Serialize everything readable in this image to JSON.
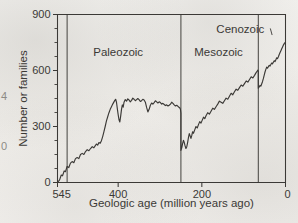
{
  "figure": {
    "kind": "scanned-line-chart",
    "ink_color": "#3b3936",
    "paper_color": "#f2f1ee"
  },
  "edge_fragments": [
    {
      "text": "4",
      "x": 1,
      "y": 96
    },
    {
      "text": "0",
      "x": 1,
      "y": 146
    }
  ],
  "chart_data": {
    "type": "line",
    "title": "",
    "xlabel": "Geologic age (million years ago)",
    "ylabel": "Number or families",
    "xlim": [
      545,
      0
    ],
    "ylim": [
      0,
      900
    ],
    "x_reversed": true,
    "grid": false,
    "legend": "none",
    "xticks": [
      545,
      400,
      200,
      0
    ],
    "xtick_labels": [
      "545",
      "400",
      "200",
      "0"
    ],
    "yticks": [
      0,
      300,
      600,
      900
    ],
    "ytick_labels": [
      "0",
      "300",
      "600",
      "900"
    ],
    "y_minor_tick_step": 75,
    "annotations": [
      {
        "name": "paleozoic-label",
        "text": "Paleozoic",
        "x": 400,
        "y": 700
      },
      {
        "name": "mesozoic-label",
        "text": "Mesozoic",
        "x": 160,
        "y": 700
      },
      {
        "name": "cenozoic-label",
        "text": "Cenozoic",
        "x": 108,
        "y": 820,
        "leader_to_x": 32,
        "leader_to_y": 790
      }
    ],
    "era_boundaries": [
      {
        "name": "paleozoic-start",
        "x": 522
      },
      {
        "name": "paleozoic-mesozoic",
        "x": 250
      },
      {
        "name": "mesozoic-cenozoic",
        "x": 65
      }
    ],
    "series": [
      {
        "name": "Number of families",
        "points": [
          [
            545,
            0
          ],
          [
            540,
            14
          ],
          [
            536,
            40
          ],
          [
            533,
            36
          ],
          [
            529,
            62
          ],
          [
            526,
            58
          ],
          [
            522,
            86
          ],
          [
            518,
            80
          ],
          [
            514,
            104
          ],
          [
            510,
            112
          ],
          [
            506,
            106
          ],
          [
            502,
            128
          ],
          [
            498,
            134
          ],
          [
            494,
            128
          ],
          [
            490,
            150
          ],
          [
            486,
            156
          ],
          [
            482,
            150
          ],
          [
            478,
            166
          ],
          [
            474,
            176
          ],
          [
            470,
            170
          ],
          [
            466,
            182
          ],
          [
            462,
            192
          ],
          [
            458,
            186
          ],
          [
            455,
            196
          ],
          [
            452,
            206
          ],
          [
            449,
            200
          ],
          [
            446,
            214
          ],
          [
            443,
            210
          ],
          [
            440,
            224
          ],
          [
            437,
            246
          ],
          [
            434,
            272
          ],
          [
            431,
            300
          ],
          [
            428,
            330
          ],
          [
            425,
            352
          ],
          [
            422,
            374
          ],
          [
            419,
            392
          ],
          [
            416,
            406
          ],
          [
            413,
            420
          ],
          [
            410,
            432
          ],
          [
            408,
            440
          ],
          [
            406,
            446
          ],
          [
            404,
            430
          ],
          [
            402,
            396
          ],
          [
            400,
            364
          ],
          [
            398,
            336
          ],
          [
            396,
            324
          ],
          [
            394,
            356
          ],
          [
            392,
            392
          ],
          [
            390,
            416
          ],
          [
            388,
            404
          ],
          [
            386,
            430
          ],
          [
            383,
            444
          ],
          [
            380,
            436
          ],
          [
            377,
            448
          ],
          [
            374,
            442
          ],
          [
            371,
            432
          ],
          [
            368,
            440
          ],
          [
            365,
            452
          ],
          [
            362,
            446
          ],
          [
            359,
            438
          ],
          [
            356,
            444
          ],
          [
            353,
            450
          ],
          [
            350,
            444
          ],
          [
            347,
            434
          ],
          [
            344,
            438
          ],
          [
            341,
            446
          ],
          [
            338,
            442
          ],
          [
            335,
            430
          ],
          [
            332,
            402
          ],
          [
            329,
            378
          ],
          [
            326,
            392
          ],
          [
            323,
            414
          ],
          [
            320,
            426
          ],
          [
            317,
            420
          ],
          [
            314,
            428
          ],
          [
            311,
            438
          ],
          [
            308,
            432
          ],
          [
            305,
            426
          ],
          [
            302,
            432
          ],
          [
            299,
            428
          ],
          [
            296,
            420
          ],
          [
            293,
            424
          ],
          [
            290,
            418
          ],
          [
            287,
            412
          ],
          [
            284,
            416
          ],
          [
            281,
            410
          ],
          [
            278,
            414
          ],
          [
            275,
            420
          ],
          [
            272,
            430
          ],
          [
            269,
            424
          ],
          [
            266,
            416
          ],
          [
            263,
            410
          ],
          [
            260,
            414
          ],
          [
            257,
            408
          ],
          [
            254,
            402
          ],
          [
            252,
            398
          ],
          [
            251,
            390
          ],
          [
            250,
            372
          ],
          [
            250,
            300
          ],
          [
            250,
            216
          ],
          [
            250,
            172
          ],
          [
            248,
            186
          ],
          [
            246,
            208
          ],
          [
            244,
            226
          ],
          [
            242,
            214
          ],
          [
            240,
            196
          ],
          [
            238,
            182
          ],
          [
            236,
            192
          ],
          [
            234,
            214
          ],
          [
            232,
            240
          ],
          [
            230,
            262
          ],
          [
            228,
            250
          ],
          [
            226,
            236
          ],
          [
            224,
            252
          ],
          [
            222,
            272
          ],
          [
            220,
            264
          ],
          [
            217,
            282
          ],
          [
            214,
            300
          ],
          [
            211,
            292
          ],
          [
            208,
            310
          ],
          [
            205,
            326
          ],
          [
            202,
            318
          ],
          [
            199,
            334
          ],
          [
            196,
            350
          ],
          [
            193,
            342
          ],
          [
            190,
            358
          ],
          [
            186,
            374
          ],
          [
            182,
            366
          ],
          [
            178,
            382
          ],
          [
            174,
            398
          ],
          [
            170,
            392
          ],
          [
            166,
            406
          ],
          [
            162,
            420
          ],
          [
            158,
            436
          ],
          [
            154,
            430
          ],
          [
            150,
            424
          ],
          [
            146,
            438
          ],
          [
            142,
            452
          ],
          [
            138,
            446
          ],
          [
            134,
            462
          ],
          [
            130,
            478
          ],
          [
            126,
            470
          ],
          [
            122,
            486
          ],
          [
            118,
            500
          ],
          [
            114,
            494
          ],
          [
            110,
            508
          ],
          [
            106,
            522
          ],
          [
            102,
            516
          ],
          [
            98,
            530
          ],
          [
            94,
            544
          ],
          [
            90,
            538
          ],
          [
            86,
            552
          ],
          [
            82,
            566
          ],
          [
            78,
            560
          ],
          [
            74,
            574
          ],
          [
            71,
            586
          ],
          [
            68,
            596
          ],
          [
            66,
            602
          ],
          [
            65,
            594
          ],
          [
            65,
            556
          ],
          [
            65,
            520
          ],
          [
            65,
            505
          ],
          [
            63,
            512
          ],
          [
            61,
            520
          ],
          [
            59,
            516
          ],
          [
            57,
            528
          ],
          [
            55,
            540
          ],
          [
            53,
            556
          ],
          [
            51,
            574
          ],
          [
            49,
            592
          ],
          [
            47,
            606
          ],
          [
            45,
            618
          ],
          [
            43,
            612
          ],
          [
            41,
            620
          ],
          [
            39,
            628
          ],
          [
            37,
            624
          ],
          [
            35,
            632
          ],
          [
            33,
            640
          ],
          [
            31,
            636
          ],
          [
            29,
            644
          ],
          [
            27,
            652
          ],
          [
            25,
            648
          ],
          [
            23,
            658
          ],
          [
            21,
            668
          ],
          [
            19,
            664
          ],
          [
            17,
            674
          ],
          [
            15,
            686
          ],
          [
            13,
            696
          ],
          [
            11,
            706
          ],
          [
            9,
            716
          ],
          [
            7,
            726
          ],
          [
            5,
            736
          ],
          [
            3,
            744
          ],
          [
            1,
            750
          ],
          [
            0,
            752
          ]
        ]
      }
    ]
  }
}
